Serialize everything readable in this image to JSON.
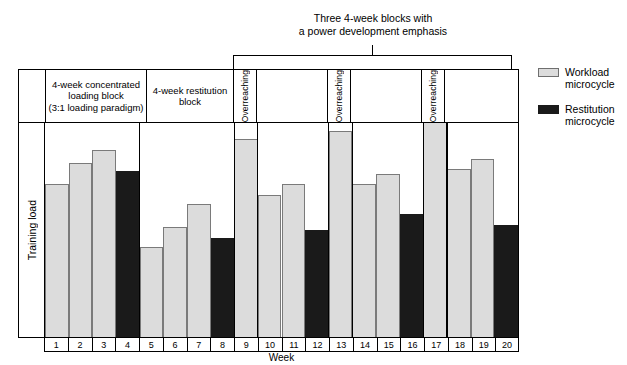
{
  "figure": {
    "top_caption_line1": "Three 4-week blocks with",
    "top_caption_line2": "a power development emphasis",
    "y_axis_label": "Training load",
    "x_axis_label": "Week"
  },
  "blocks": [
    {
      "id": "block-loading",
      "label": "4-week concentrated\nloading block\n(3:1 loading paradigm)",
      "line1": "4-week concentrated",
      "line2": "loading block",
      "line3": "(3:1 loading paradigm)"
    },
    {
      "id": "block-restitution",
      "line1": "4-week restitution",
      "line2": "block"
    }
  ],
  "overreaching_label": "Overreaching",
  "legend": [
    {
      "key": "workload",
      "line1": "Workload",
      "line2": "microcycle",
      "color": "#dcdcdc"
    },
    {
      "key": "restitution",
      "line1": "Restitution",
      "line2": "microcycle",
      "color": "#1a1a1a"
    }
  ],
  "chart_data": {
    "type": "bar",
    "title": "",
    "xlabel": "Week",
    "ylabel": "Training load",
    "grid": false,
    "legend_position": "right",
    "categories": [
      "1",
      "2",
      "3",
      "4",
      "5",
      "6",
      "7",
      "8",
      "9",
      "10",
      "11",
      "12",
      "13",
      "14",
      "15",
      "16",
      "17",
      "18",
      "19",
      "20"
    ],
    "series": [
      {
        "name": "Training load",
        "values": [
          71,
          81,
          87,
          77,
          42,
          51,
          62,
          46,
          92,
          66,
          71,
          50,
          96,
          71,
          76,
          57,
          100,
          78,
          83,
          52
        ]
      }
    ],
    "bar_types": [
      "workload",
      "workload",
      "workload",
      "restitution",
      "workload",
      "workload",
      "workload",
      "restitution",
      "workload",
      "workload",
      "workload",
      "restitution",
      "workload",
      "workload",
      "workload",
      "restitution",
      "workload",
      "workload",
      "workload",
      "restitution"
    ],
    "ylim": [
      0,
      100
    ],
    "y_ticks_shown": false,
    "annotations": [
      {
        "text": "4-week concentrated loading block (3:1 loading paradigm)",
        "weeks": [
          1,
          4
        ]
      },
      {
        "text": "4-week restitution block",
        "weeks": [
          5,
          8
        ]
      },
      {
        "text": "Overreaching",
        "weeks": [
          9,
          9
        ]
      },
      {
        "text": "Overreaching",
        "weeks": [
          13,
          13
        ]
      },
      {
        "text": "Overreaching",
        "weeks": [
          17,
          17
        ]
      },
      {
        "text": "Three 4-week blocks with a power development emphasis",
        "weeks": [
          9,
          20
        ]
      }
    ]
  }
}
